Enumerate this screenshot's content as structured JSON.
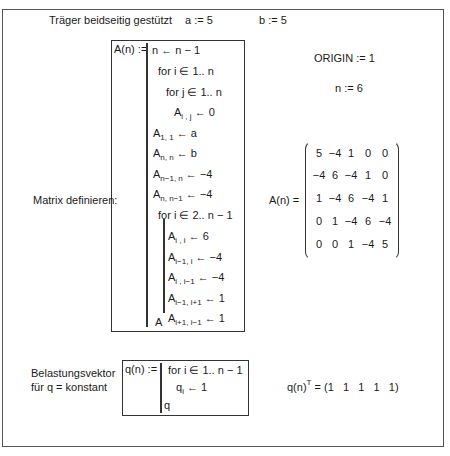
{
  "header": {
    "title": "Träger beidseitig gestützt",
    "def_a": "a := 5",
    "def_b": "b := 5"
  },
  "settings": {
    "origin": "ORIGIN := 1",
    "n_def": "n := 6"
  },
  "matrix_program": {
    "lhs": "A(n) :=",
    "lines": [
      {
        "base": "n ← n − 1"
      },
      {
        "base": "for  i ∈ 1.. n"
      },
      {
        "base": "for  j ∈ 1.. n"
      },
      {
        "base": "A",
        "sub": "i , j",
        "rest": " ← 0"
      },
      {
        "base": "A",
        "sub": "1, 1",
        "rest": " ← a"
      },
      {
        "base": "A",
        "sub": "n, n",
        "rest": " ← b"
      },
      {
        "base": "A",
        "sub": "n−1, n",
        "rest": " ← −4"
      },
      {
        "base": "A",
        "sub": "n, n−1",
        "rest": " ← −4"
      },
      {
        "base": "for  i ∈ 2.. n − 1"
      },
      {
        "base": "A",
        "sub": "i , i",
        "rest": " ← 6"
      },
      {
        "base": "A",
        "sub": "i−1, i",
        "rest": " ← −4"
      },
      {
        "base": "A",
        "sub": "i , i−1",
        "rest": " ← −4"
      },
      {
        "base": "A",
        "sub": "i−1, i+1",
        "rest": " ← 1"
      },
      {
        "base": "A",
        "sub": "i+1, i−1",
        "rest": " ← 1"
      },
      {
        "base": "A"
      }
    ]
  },
  "matrix_label": "Matrix definieren:",
  "matrix_result": {
    "lhs": "A(n) =",
    "rows": [
      [
        "5",
        "−4",
        "1",
        "0",
        "0"
      ],
      [
        "−4",
        "6",
        "−4",
        "1",
        "0"
      ],
      [
        "1",
        "−4",
        "6",
        "−4",
        "1"
      ],
      [
        "0",
        "1",
        "−4",
        "6",
        "−4"
      ],
      [
        "0",
        "0",
        "1",
        "−4",
        "5"
      ]
    ]
  },
  "load_vector": {
    "label_line1": "Belastungsvektor",
    "label_line2": "für q = konstant",
    "lhs": "q(n) :=",
    "lines": [
      {
        "base": "for  i ∈ 1.. n − 1"
      },
      {
        "base": "q",
        "sub": "i",
        "rest": " ← 1"
      },
      {
        "base": "q"
      }
    ],
    "result_lhs": "q(n)",
    "result_sup": "T",
    "result_rhs": " = (1   1   1   1   1)"
  }
}
